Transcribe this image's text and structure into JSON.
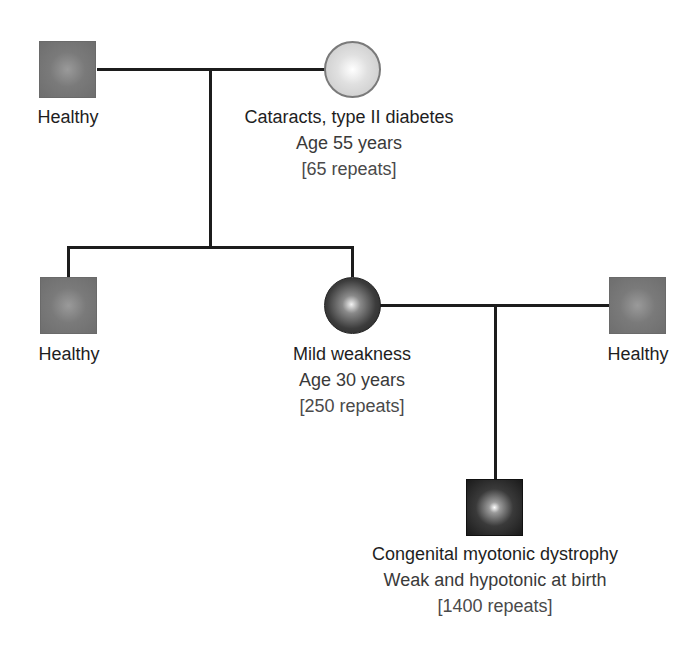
{
  "diagram": {
    "type": "pedigree",
    "condition": "myotonic dystrophy (anticipation)",
    "colors": {
      "line": "#1c1c1c",
      "healthy_male_fill": "#7a7a7a",
      "grandmother_fill": "#d0d0d0",
      "mother_fill": "#303030",
      "proband_fill": "#1a1a1a",
      "text": "#1e1e1e"
    }
  },
  "generation1": {
    "grandfather": {
      "sex": "male",
      "status": "healthy",
      "label": "Healthy"
    },
    "grandmother": {
      "sex": "female",
      "status": "mildly affected",
      "label": "Cataracts, type II diabetes",
      "age": "Age 55 years",
      "repeats": "[65 repeats]"
    }
  },
  "generation2": {
    "son": {
      "sex": "male",
      "status": "healthy",
      "label": "Healthy"
    },
    "mother": {
      "sex": "female",
      "status": "affected",
      "label": "Mild weakness",
      "age": "Age 30 years",
      "repeats": "[250 repeats]"
    },
    "father": {
      "sex": "male",
      "status": "healthy",
      "label": "Healthy"
    }
  },
  "generation3": {
    "proband": {
      "sex": "male",
      "status": "severely affected",
      "label": "Congenital myotonic dystrophy",
      "detail": "Weak and hypotonic at birth",
      "repeats": "[1400 repeats]"
    }
  }
}
